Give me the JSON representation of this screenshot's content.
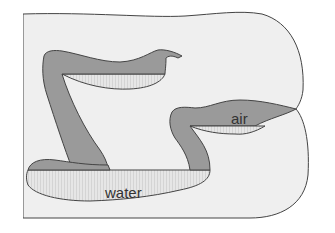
{
  "diagram": {
    "labels": {
      "air": "air",
      "water": "water"
    },
    "colors": {
      "background": "#ffffff",
      "body_fill": "#eeeeee",
      "outline": "#444444",
      "air_fill": "#9a9a9a",
      "water_fill": "#e3e3e3"
    }
  }
}
